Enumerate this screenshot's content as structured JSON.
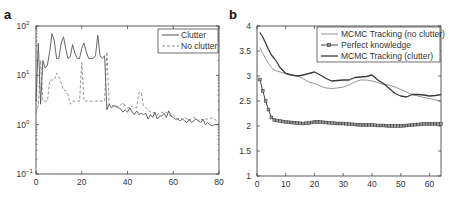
{
  "chart_data": [
    {
      "panel": "a",
      "type": "line",
      "title": "",
      "xlabel": "",
      "ylabel": "",
      "yscale": "log",
      "xlim": [
        0,
        80
      ],
      "ylim": [
        0.1,
        100
      ],
      "x_ticks": [
        "0",
        "20",
        "40",
        "60",
        "80"
      ],
      "y_ticks": [
        "10^-1",
        "10^0",
        "10^1",
        "10^2"
      ],
      "legend_position": "upper right",
      "grid": false,
      "series": [
        {
          "name": "Clutter",
          "style": "solid",
          "x": [
            0,
            1,
            2,
            3,
            4,
            5,
            6,
            7,
            8,
            9,
            10,
            11,
            12,
            13,
            14,
            15,
            16,
            17,
            18,
            19,
            20,
            21,
            22,
            23,
            24,
            25,
            26,
            27,
            28,
            29,
            30,
            31,
            32,
            33,
            34,
            35,
            36,
            37,
            38,
            39,
            40,
            41,
            42,
            43,
            44,
            45,
            46,
            47,
            48,
            49,
            50,
            51,
            52,
            53,
            54,
            55,
            56,
            57,
            58,
            59,
            60,
            61,
            62,
            63,
            64,
            65,
            66,
            67,
            68,
            69,
            70,
            71,
            72,
            73,
            74,
            75,
            76,
            77,
            78,
            79,
            80
          ],
          "values": [
            3,
            45,
            2.6,
            20,
            14,
            16,
            30,
            70,
            50,
            22,
            22,
            45,
            60,
            35,
            22,
            24,
            42,
            28,
            22,
            22,
            35,
            45,
            30,
            22,
            22,
            22,
            25,
            65,
            25,
            22,
            25,
            2.0,
            2.6,
            2.2,
            2.4,
            2.4,
            2.2,
            2.1,
            1.8,
            2.0,
            1.8,
            2.2,
            1.8,
            1.6,
            1.9,
            1.6,
            1.7,
            1.6,
            1.7,
            1.3,
            1.6,
            1.4,
            1.8,
            1.3,
            1.5,
            1.5,
            1.7,
            1.4,
            1.9,
            1.5,
            1.4,
            1.3,
            1.3,
            1.2,
            1.3,
            1.2,
            1.1,
            1.3,
            1.1,
            1.2,
            1.3,
            1.2,
            1.1,
            1.3,
            1.0,
            1.1,
            1.0,
            0.95,
            1.0,
            1.0,
            1.05
          ]
        },
        {
          "name": "No clutter",
          "style": "dashed",
          "x": [
            0,
            1,
            2,
            3,
            4,
            5,
            6,
            7,
            8,
            9,
            10,
            11,
            12,
            13,
            14,
            15,
            16,
            17,
            18,
            19,
            20,
            21,
            22,
            23,
            24,
            25,
            26,
            27,
            28,
            29,
            30,
            31,
            32,
            33,
            34,
            35,
            36,
            37,
            38,
            39,
            40,
            41,
            42,
            43,
            44,
            45,
            46,
            47,
            48,
            49,
            50,
            51,
            52,
            53,
            54,
            55,
            56,
            57,
            58,
            59,
            60,
            61,
            62,
            63,
            64,
            65,
            66,
            67,
            68,
            69,
            70,
            71,
            72,
            73,
            74,
            75,
            76,
            77,
            78,
            79,
            80
          ],
          "values": [
            1.7,
            2.5,
            20,
            3,
            3,
            3,
            8,
            8,
            8,
            11,
            9,
            7,
            5,
            5,
            4,
            2.6,
            3,
            3,
            3,
            3,
            18,
            3,
            3,
            3,
            3,
            3,
            3,
            3,
            3,
            3,
            3,
            30,
            2.5,
            2.5,
            2.4,
            2.2,
            2.4,
            2.5,
            2.8,
            2.4,
            2.2,
            2.2,
            2.4,
            2.2,
            2.2,
            4.5,
            4.5,
            2.4,
            2.2,
            2.0,
            1.8,
            1.7,
            1.8,
            1.6,
            1.7,
            1.8,
            1.7,
            1.8,
            1.6,
            1.5,
            1.6,
            1.4,
            1.3,
            1.4,
            1.3,
            1.4,
            1.3,
            1.2,
            1.3,
            1.4,
            1.3,
            1.2,
            1.3,
            1.2,
            1.3,
            1.3,
            1.3,
            1.4,
            1.3,
            1.2,
            1.2
          ]
        }
      ]
    },
    {
      "panel": "b",
      "type": "line",
      "title": "",
      "xlabel": "",
      "ylabel": "",
      "xlim": [
        0,
        64
      ],
      "ylim": [
        1,
        4
      ],
      "x_ticks": [
        "0",
        "10",
        "20",
        "30",
        "40",
        "50",
        "60"
      ],
      "y_ticks": [
        "1",
        "1.5",
        "2",
        "2.5",
        "3",
        "3.5",
        "4"
      ],
      "legend_position": "upper right",
      "grid": false,
      "series": [
        {
          "name": "MCMC Tracking (no clutter)",
          "style": "solid-thin",
          "x": [
            1,
            2,
            3,
            4,
            5,
            6,
            7,
            8,
            10,
            12,
            14,
            16,
            18,
            20,
            22,
            24,
            26,
            28,
            30,
            32,
            34,
            36,
            38,
            40,
            42,
            44,
            46,
            48,
            50,
            52,
            54,
            56,
            58,
            60,
            62,
            64
          ],
          "values": [
            3.57,
            3.45,
            3.35,
            3.25,
            3.17,
            3.12,
            3.1,
            3.08,
            3.05,
            3.02,
            3.0,
            2.95,
            2.88,
            2.85,
            2.8,
            2.76,
            2.75,
            2.76,
            2.78,
            2.82,
            2.88,
            2.92,
            2.92,
            2.9,
            2.87,
            2.83,
            2.82,
            2.78,
            2.73,
            2.68,
            2.63,
            2.6,
            2.57,
            2.55,
            2.52,
            2.5
          ]
        },
        {
          "name": "Perfect knowledge",
          "style": "solid-square-markers",
          "x": [
            1,
            2,
            3,
            4,
            5,
            6,
            7,
            8,
            10,
            12,
            14,
            16,
            18,
            20,
            22,
            24,
            26,
            28,
            30,
            32,
            34,
            36,
            38,
            40,
            42,
            44,
            46,
            48,
            50,
            52,
            54,
            56,
            58,
            60,
            62,
            64
          ],
          "values": [
            2.93,
            2.7,
            2.5,
            2.33,
            2.17,
            2.12,
            2.11,
            2.1,
            2.08,
            2.07,
            2.06,
            2.05,
            2.06,
            2.08,
            2.08,
            2.07,
            2.06,
            2.05,
            2.05,
            2.04,
            2.03,
            2.02,
            2.02,
            2.02,
            2.01,
            2.01,
            2.0,
            2.0,
            2.0,
            2.01,
            2.02,
            2.03,
            2.04,
            2.04,
            2.04,
            2.04
          ]
        },
        {
          "name": "MCMC Tracking (clutter)",
          "style": "solid-thick",
          "x": [
            1,
            2,
            3,
            4,
            5,
            6,
            7,
            8,
            10,
            12,
            14,
            16,
            18,
            20,
            22,
            24,
            26,
            28,
            30,
            32,
            34,
            36,
            38,
            40,
            42,
            44,
            46,
            48,
            50,
            52,
            54,
            56,
            58,
            60,
            62,
            64
          ],
          "values": [
            3.87,
            3.78,
            3.66,
            3.53,
            3.42,
            3.35,
            3.27,
            3.17,
            3.05,
            3.02,
            3.0,
            3.02,
            3.05,
            3.08,
            3.02,
            2.95,
            2.9,
            2.91,
            2.92,
            2.92,
            2.97,
            2.98,
            2.99,
            3.02,
            2.92,
            2.85,
            2.75,
            2.65,
            2.6,
            2.58,
            2.63,
            2.63,
            2.62,
            2.6,
            2.61,
            2.63
          ]
        }
      ]
    }
  ],
  "panels": {
    "a": {
      "label": "a",
      "x_ticks": [
        "0",
        "20",
        "40",
        "60",
        "80"
      ],
      "y_tick_base": "10",
      "y_tick_exps": [
        "2",
        "1",
        "0",
        "−1"
      ],
      "legend": [
        "Clutter",
        "No clutter"
      ]
    },
    "b": {
      "label": "b",
      "x_ticks": [
        "0",
        "10",
        "20",
        "30",
        "40",
        "50",
        "60"
      ],
      "y_ticks": [
        "4",
        "3.5",
        "3",
        "2.5",
        "2",
        "1.5",
        "1"
      ],
      "legend": [
        "MCMC Tracking (no clutter)",
        "Perfect knowledge",
        "MCMC Tracking (clutter)"
      ]
    }
  },
  "colors": {
    "axis": "#333333",
    "clutter": "#555555",
    "no_clutter": "#8a8a8a",
    "mcmc_no_clutter": "#7a7a7a",
    "perfect": "#444444",
    "mcmc_clutter": "#3a3a3a"
  }
}
